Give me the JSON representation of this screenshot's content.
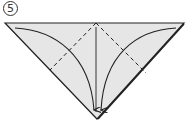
{
  "step": {
    "number": "5"
  },
  "diagram": {
    "paper_color": "#e6e6e6",
    "line_color": "#222222",
    "shape": "triangle",
    "elements": [
      "valley-fold-dashed-left",
      "valley-fold-dashed-right",
      "center-crease",
      "curved-arrow-left",
      "curved-arrow-right"
    ]
  }
}
